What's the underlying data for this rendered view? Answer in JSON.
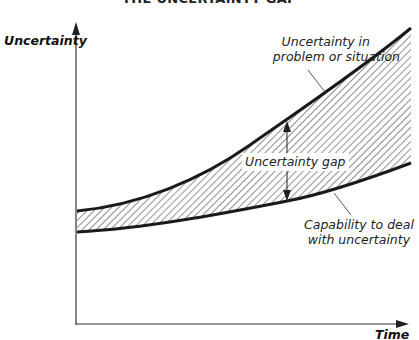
{
  "diagram": {
    "title": "THE UNCERTAINTY GAP",
    "y_axis_label": "Uncertainty",
    "x_axis_label": "Time",
    "upper_curve_label_line1": "Uncertainty in",
    "upper_curve_label_line2": "problem or situation",
    "lower_curve_label_line1": "Capability to deal",
    "lower_curve_label_line2": "with uncertainty",
    "gap_label": "Uncertainty gap",
    "colors": {
      "line": "#1a1a1a",
      "hatch": "#333333",
      "background": "#ffffff"
    }
  }
}
